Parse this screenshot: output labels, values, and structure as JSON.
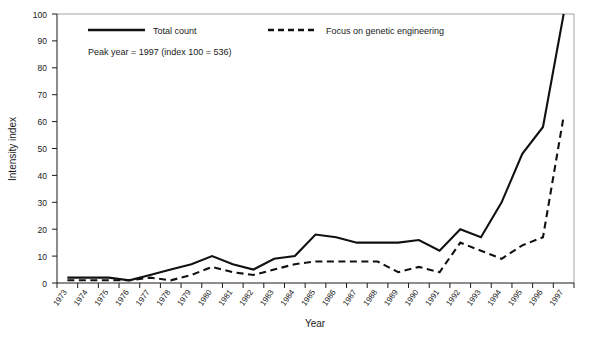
{
  "chart_data": {
    "type": "line",
    "title": "",
    "xlabel": "Year",
    "ylabel": "Intensity index",
    "ylim": [
      0,
      100
    ],
    "yticks": [
      0,
      10,
      20,
      30,
      40,
      50,
      60,
      70,
      80,
      90,
      100
    ],
    "grid": false,
    "legend_position": "top-left inside",
    "annotations": [
      "Peak year = 1997 (index 100 = 536)"
    ],
    "categories": [
      "1973",
      "1974",
      "1975",
      "1976",
      "1977",
      "1978",
      "1979",
      "1980",
      "1981",
      "1982",
      "1983",
      "1984",
      "1985",
      "1986",
      "1987",
      "1988",
      "1989",
      "1990",
      "1991",
      "1992",
      "1993",
      "1994",
      "1995",
      "1996",
      "1997"
    ],
    "series": [
      {
        "name": "Total count",
        "style": "solid",
        "values": [
          2,
          2,
          2,
          1,
          3,
          5,
          7,
          10,
          7,
          5,
          9,
          10,
          18,
          17,
          15,
          15,
          15,
          16,
          12,
          20,
          17,
          30,
          48,
          58,
          100
        ]
      },
      {
        "name": "Focus on genetic engineering",
        "style": "dashed",
        "values": [
          1,
          1,
          1,
          1,
          2,
          1,
          3,
          6,
          4,
          3,
          5,
          7,
          8,
          8,
          8,
          8,
          4,
          6,
          4,
          15,
          12,
          9,
          14,
          17,
          62
        ]
      }
    ]
  },
  "axes": {
    "ylabel": "Intensity index",
    "xlabel": "Year"
  },
  "legend": {
    "items": [
      {
        "label": "Total count",
        "style": "solid"
      },
      {
        "label": "Focus on genetic engineering",
        "style": "dashed"
      }
    ]
  },
  "note": {
    "text": "Peak year = 1997 (index 100 = 536)"
  },
  "colors": {
    "line": "#111111",
    "axis": "#1a1a1a",
    "frame": "#8a8a8a",
    "background": "#ffffff"
  }
}
